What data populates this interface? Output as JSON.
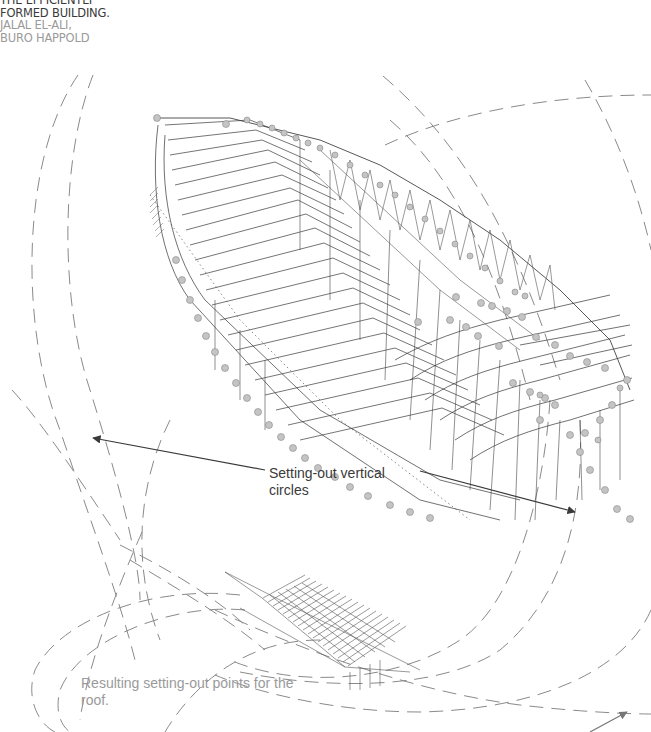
{
  "header": {
    "title_line1": "THE EFFICIENTLY",
    "title_line2": "FORMED BUILDING.",
    "author_line1": "JALAL EL-ALI,",
    "author_line2": "BURO HAPPOLD"
  },
  "annotations": {
    "setting_out_line1": "Setting-out vertical",
    "setting_out_line2": "circles",
    "resulting_line1": "Resulting setting-out points for the",
    "resulting_line2": "roof."
  },
  "colors": {
    "dash": "#8a8a8a",
    "structure": "#333333",
    "node": "#b8b8b8",
    "arrow": "#3a3a3a",
    "caption_grey": "#9a9a9a"
  }
}
